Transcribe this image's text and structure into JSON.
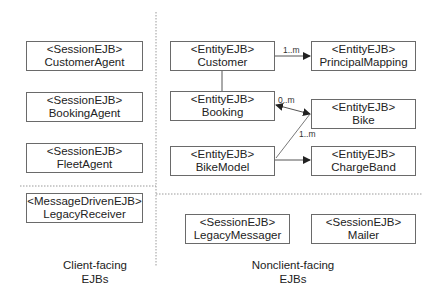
{
  "diagram": {
    "partitions": {
      "client_facing": {
        "label_line1": "Client-facing",
        "label_line2": "EJBs"
      },
      "nonclient_facing": {
        "label_line1": "Nonclient-facing",
        "label_line2": "EJBs"
      }
    },
    "boxes": {
      "customer_agent": {
        "stereotype": "<SessionEJB>",
        "name": "CustomerAgent"
      },
      "booking_agent": {
        "stereotype": "<SessionEJB>",
        "name": "BookingAgent"
      },
      "fleet_agent": {
        "stereotype": "<SessionEJB>",
        "name": "FleetAgent"
      },
      "legacy_receiver": {
        "stereotype": "<MessageDrivenEJB>",
        "name": "LegacyReceiver"
      },
      "customer": {
        "stereotype": "<EntityEJB>",
        "name": "Customer"
      },
      "principal_mapping": {
        "stereotype": "<EntityEJB>",
        "name": "PrincipalMapping"
      },
      "booking": {
        "stereotype": "<EntityEJB>",
        "name": "Booking"
      },
      "bike": {
        "stereotype": "<EntityEJB>",
        "name": "Bike"
      },
      "bike_model": {
        "stereotype": "<EntityEJB>",
        "name": "BikeModel"
      },
      "charge_band": {
        "stereotype": "<EntityEJB>",
        "name": "ChargeBand"
      },
      "legacy_messager": {
        "stereotype": "<SessionEJB>",
        "name": "LegacyMessager"
      },
      "mailer": {
        "stereotype": "<SessionEJB>",
        "name": "Mailer"
      }
    },
    "relations": {
      "customer_principal_mapping": {
        "from": "Customer",
        "to": "PrincipalMapping",
        "multiplicity": "1..m"
      },
      "customer_booking": {
        "from": "Customer",
        "to": "Booking",
        "multiplicity": ""
      },
      "booking_bike": {
        "from": "Booking",
        "to": "Bike",
        "multiplicity": "0..m"
      },
      "bike_model_bike": {
        "from": "BikeModel",
        "to": "Bike",
        "multiplicity": "1..m"
      },
      "bike_model_charge_band": {
        "from": "BikeModel",
        "to": "ChargeBand",
        "multiplicity": ""
      }
    },
    "colors": {
      "box_border": "#6a6a6a",
      "connector": "#555555",
      "divider": "#9a9a9a",
      "text": "#222222"
    }
  }
}
